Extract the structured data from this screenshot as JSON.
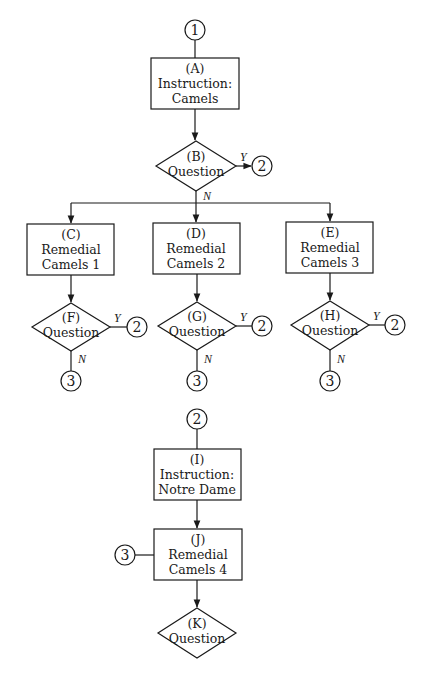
{
  "diagram": {
    "type": "flowchart",
    "nodes": {
      "A": {
        "id": "(A)",
        "line1": "Instruction:",
        "line2": "Camels",
        "shape": "box"
      },
      "B": {
        "id": "(B)",
        "line1": "Question",
        "shape": "diamond"
      },
      "C": {
        "id": "(C)",
        "line1": "Remedial",
        "line2": "Camels 1",
        "shape": "box"
      },
      "D": {
        "id": "(D)",
        "line1": "Remedial",
        "line2": "Camels 2",
        "shape": "box"
      },
      "E": {
        "id": "(E)",
        "line1": "Remedial",
        "line2": "Camels 3",
        "shape": "box"
      },
      "F": {
        "id": "(F)",
        "line1": "Question",
        "shape": "diamond"
      },
      "G": {
        "id": "(G)",
        "line1": "Question",
        "shape": "diamond"
      },
      "H": {
        "id": "(H)",
        "line1": "Question",
        "shape": "diamond"
      },
      "I": {
        "id": "(I)",
        "line1": "Instruction:",
        "line2": "Notre Dame",
        "shape": "box"
      },
      "J": {
        "id": "(J)",
        "line1": "Remedial",
        "line2": "Camels 4",
        "shape": "box"
      },
      "K": {
        "id": "(K)",
        "line1": "Question",
        "shape": "diamond"
      }
    },
    "connectors": {
      "start": "1",
      "b_yes": "2",
      "f_yes": "2",
      "g_yes": "2",
      "h_yes": "2",
      "f_no": "3",
      "g_no": "3",
      "h_no": "3",
      "entry_i": "2",
      "entry_j": "3"
    },
    "edge_labels": {
      "yes": "Y",
      "no": "N"
    },
    "edges": [
      {
        "from": "1",
        "to": "A"
      },
      {
        "from": "A",
        "to": "B"
      },
      {
        "from": "B",
        "to": "2",
        "label": "Y"
      },
      {
        "from": "B",
        "to": "C",
        "label": "N"
      },
      {
        "from": "B",
        "to": "D",
        "label": "N"
      },
      {
        "from": "B",
        "to": "E",
        "label": "N"
      },
      {
        "from": "C",
        "to": "F"
      },
      {
        "from": "D",
        "to": "G"
      },
      {
        "from": "E",
        "to": "H"
      },
      {
        "from": "F",
        "to": "2",
        "label": "Y"
      },
      {
        "from": "F",
        "to": "3",
        "label": "N"
      },
      {
        "from": "G",
        "to": "2",
        "label": "Y"
      },
      {
        "from": "G",
        "to": "3",
        "label": "N"
      },
      {
        "from": "H",
        "to": "2",
        "label": "Y"
      },
      {
        "from": "H",
        "to": "3",
        "label": "N"
      },
      {
        "from": "2",
        "to": "I"
      },
      {
        "from": "I",
        "to": "J"
      },
      {
        "from": "3",
        "to": "J"
      },
      {
        "from": "J",
        "to": "K"
      }
    ]
  },
  "colors": {
    "stroke": "#1a1a1a",
    "background": "#ffffff"
  }
}
